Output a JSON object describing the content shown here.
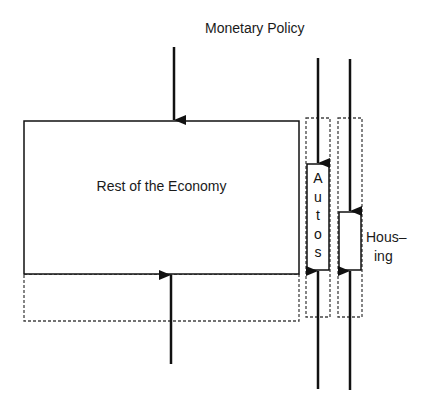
{
  "diagram": {
    "title": "Monetary Policy",
    "nodes": [
      {
        "id": "rest",
        "label": "Rest of the Economy"
      },
      {
        "id": "autos",
        "label": "Autos",
        "letters": [
          "A",
          "u",
          "t",
          "o",
          "s"
        ]
      },
      {
        "id": "housing",
        "label_lines": [
          "Hous–",
          "ing"
        ]
      }
    ],
    "edges": [
      {
        "from": "monetary-policy",
        "to": "rest",
        "direction": "down"
      },
      {
        "from": "below",
        "to": "rest",
        "direction": "up"
      },
      {
        "from": "monetary-policy",
        "to": "autos",
        "direction": "down"
      },
      {
        "from": "below",
        "to": "autos",
        "direction": "up"
      },
      {
        "from": "monetary-policy",
        "to": "housing",
        "direction": "down"
      },
      {
        "from": "below",
        "to": "housing",
        "direction": "up"
      }
    ],
    "colors": {
      "line": "#111111",
      "dashed": "#333333",
      "background": "#ffffff"
    }
  }
}
